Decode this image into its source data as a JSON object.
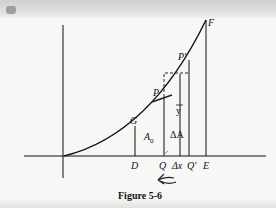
{
  "figure": {
    "caption": "Figure 5-6",
    "points": {
      "F": "F",
      "P_prime": "P′",
      "P": "P",
      "G": "G",
      "D": "D",
      "Q": "Q",
      "delta_x": "Δx",
      "Q_prime": "Q′",
      "E": "E"
    },
    "area_labels": {
      "A0": "A",
      "A0_sub": "0",
      "delta_A": "ΔA",
      "y_bar": "y"
    },
    "colors": {
      "ink": "#111111",
      "paper": "#f7f7f5",
      "pencil_mark": "#888888"
    }
  }
}
